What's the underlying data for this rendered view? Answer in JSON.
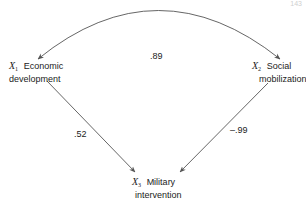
{
  "page_number": "143",
  "nodes": {
    "x1": {
      "var": "X",
      "sub": "1",
      "label_line1": "Economic",
      "label_line2": "development"
    },
    "x2": {
      "var": "X",
      "sub": "2",
      "label_line1": "Social",
      "label_line2": "mobilization"
    },
    "x3": {
      "var": "X",
      "sub": "3",
      "label_line1": "Military",
      "label_line2": "intervention"
    }
  },
  "edges": {
    "x1_x2_correlation": ".89",
    "x1_to_x3": ".52",
    "x2_to_x3": "–.99"
  },
  "colors": {
    "line": "#555555",
    "text": "#222222"
  }
}
